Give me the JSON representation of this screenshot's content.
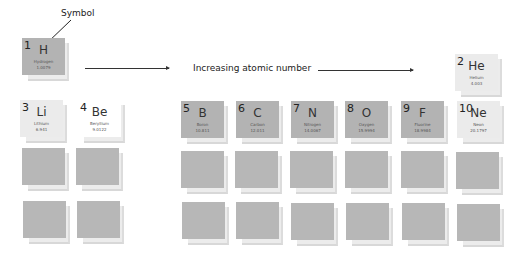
{
  "annotations": {
    "symbol_label": "Symbol",
    "axis_label": "Increasing atomic number"
  },
  "elements": [
    {
      "number": "1",
      "symbol": "H",
      "name": "Hydrogen",
      "mass": "1.0079"
    },
    {
      "number": "2",
      "symbol": "He",
      "name": "Helium",
      "mass": "4.003"
    },
    {
      "number": "3",
      "symbol": "Li",
      "name": "Lithium",
      "mass": "6.941"
    },
    {
      "number": "4",
      "symbol": "Be",
      "name": "Beryllium",
      "mass": "9.0122"
    },
    {
      "number": "5",
      "symbol": "B",
      "name": "Boron",
      "mass": "10.811"
    },
    {
      "number": "6",
      "symbol": "C",
      "name": "Carbon",
      "mass": "12.011"
    },
    {
      "number": "7",
      "symbol": "N",
      "name": "Nitrogen",
      "mass": "14.0067"
    },
    {
      "number": "8",
      "symbol": "O",
      "name": "Oxygen",
      "mass": "15.9994"
    },
    {
      "number": "9",
      "symbol": "F",
      "name": "Fluorine",
      "mass": "18.9984"
    },
    {
      "number": "10",
      "symbol": "Ne",
      "name": "Neon",
      "mass": "20.1797"
    }
  ],
  "colors": {
    "tile_dark": "#b3b3b3",
    "tile_light": "#ebebeb",
    "tile_blank": "#b7b7b7"
  }
}
